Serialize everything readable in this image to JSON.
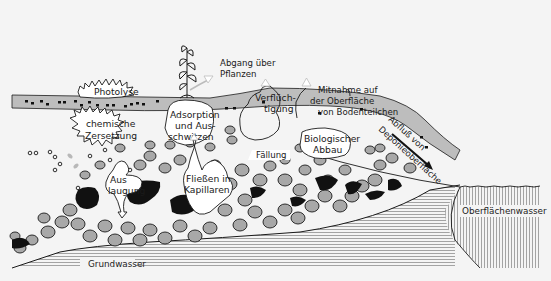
{
  "diagram": {
    "title": "",
    "colors": {
      "background": "#f4f4f4",
      "soil_band": "#bdbdbd",
      "stone_fill": "#a8a8a8",
      "contaminant_black": "#111111",
      "water_lines": "#9a9a9a",
      "bubble_fill": "#ffffff",
      "outline": "#1a1a1a"
    },
    "labels": {
      "photolyse": "Photolyse",
      "abgang_line1": "Abgang über",
      "abgang_line2": "Pflanzen",
      "chemische_line1": "chemische",
      "chemische_line2": "Zersetzung",
      "adsorption_line1": "Adsorption",
      "adsorption_line2": "und Aus-",
      "adsorption_line3": "schwitzen",
      "verfluechtigung_line1": "Verflüch-",
      "verfluechtigung_line2": "tigung",
      "mitnahme_line1": "Mitnahme auf",
      "mitnahme_line2": "der Oberfläche",
      "mitnahme_line3": "von Bodenteilchen",
      "auslaugung_line1": "Aus",
      "auslaugung_line2": "laugung",
      "fliessen_line1": "Fließen in",
      "fliessen_line2": "Kapillaren",
      "faellung": "Fällung",
      "biologisch_line1": "Biologischer",
      "biologisch_line2": "Abbau",
      "abfluss_line1": "Abfluß von",
      "abfluss_line2": "Deponieoberfläche",
      "grundwasser": "Grundwasser",
      "oberflaechenwasser": "Oberflächenwasser"
    }
  }
}
